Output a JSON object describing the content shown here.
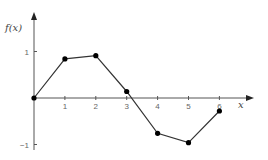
{
  "chart_data": {
    "type": "line",
    "title": "",
    "xlabel": "x",
    "ylabel": "f(x)",
    "x": [
      0,
      1,
      2,
      3,
      4,
      5,
      6
    ],
    "series": [
      {
        "name": "f(x)",
        "values": [
          0,
          0.84,
          0.91,
          0.14,
          -0.76,
          -0.96,
          -0.28
        ]
      }
    ],
    "x_ticks": [
      "1",
      "2",
      "3",
      "4",
      "5",
      "6"
    ],
    "y_ticks": [
      "1",
      "-1"
    ],
    "xlim": [
      0,
      7
    ],
    "ylim": [
      -1,
      1.8
    ],
    "grid": false,
    "legend": "none",
    "markers": true
  },
  "colors": {
    "axis": "#555555",
    "line": "#333333",
    "marker": "#000000"
  }
}
